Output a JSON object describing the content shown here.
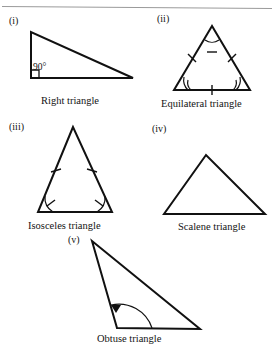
{
  "figure": {
    "title_rule": "horizontal-rule",
    "background_color": "#ffffff",
    "stroke_color": "#111111",
    "rule_color": "#9a9a9a",
    "items": [
      {
        "numeral": "(i)",
        "caption": "Right triangle",
        "angle_label": "90°",
        "marks": "right-angle-square"
      },
      {
        "numeral": "(ii)",
        "caption": "Equilateral triangle",
        "marks": "three-equal-sides-three-equal-angles"
      },
      {
        "numeral": "(iii)",
        "caption": "Isosceles triangle",
        "marks": "two-equal-sides-two-equal-angles"
      },
      {
        "numeral": "(iv)",
        "caption": "Scalene triangle",
        "marks": "none"
      },
      {
        "numeral": "(v)",
        "caption": "Obtuse triangle",
        "marks": "obtuse-angle-arrow-arc"
      }
    ]
  },
  "geometry": {
    "right": {
      "points": "31,32 31,78 133,78"
    },
    "equilateral": {
      "points": "212,26 174,90 250,90"
    },
    "isosceles": {
      "points": "73,127 38,212 112,212"
    },
    "scalene": {
      "points": "206,155 164,214 265,214"
    },
    "obtuse": {
      "points": "92,241 117,328 200,329"
    }
  }
}
